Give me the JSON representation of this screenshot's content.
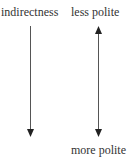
{
  "diagram": {
    "left_axis": {
      "label": "indirectness",
      "direction": "down"
    },
    "right_axis": {
      "top_label": "less polite",
      "bottom_label": "more polite",
      "direction": "bidirectional"
    },
    "colors": {
      "text": "#333333",
      "line": "#555555",
      "arrowhead": "#222222"
    }
  }
}
